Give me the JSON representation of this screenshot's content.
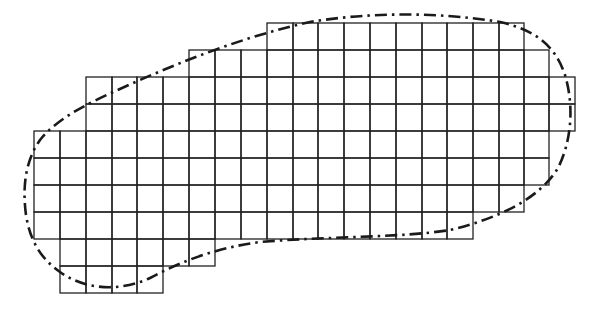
{
  "figure": {
    "colors": {
      "background": "#ffffff",
      "grid_line": "#222222",
      "boundary": "#1a1a1a"
    },
    "grid": {
      "x_lines": [
        34,
        60,
        86,
        112,
        137,
        163,
        189,
        215,
        241,
        267,
        293,
        318,
        344,
        370,
        396,
        422,
        447,
        473,
        499,
        524,
        549,
        575
      ],
      "y_lines": [
        23,
        50,
        77,
        104,
        131,
        158,
        185,
        212,
        239,
        266,
        293
      ],
      "columns": [
        {
          "col": 0,
          "top": 4,
          "bottom": 8
        },
        {
          "col": 1,
          "top": 4,
          "bottom": 10
        },
        {
          "col": 2,
          "top": 2,
          "bottom": 10
        },
        {
          "col": 3,
          "top": 2,
          "bottom": 10
        },
        {
          "col": 4,
          "top": 2,
          "bottom": 10
        },
        {
          "col": 5,
          "top": 2,
          "bottom": 9
        },
        {
          "col": 6,
          "top": 1,
          "bottom": 9
        },
        {
          "col": 7,
          "top": 1,
          "bottom": 8
        },
        {
          "col": 8,
          "top": 1,
          "bottom": 8
        },
        {
          "col": 9,
          "top": 0,
          "bottom": 8
        },
        {
          "col": 10,
          "top": 0,
          "bottom": 8
        },
        {
          "col": 11,
          "top": 0,
          "bottom": 8
        },
        {
          "col": 12,
          "top": 0,
          "bottom": 8
        },
        {
          "col": 13,
          "top": 0,
          "bottom": 8
        },
        {
          "col": 14,
          "top": 0,
          "bottom": 8
        },
        {
          "col": 15,
          "top": 0,
          "bottom": 8
        },
        {
          "col": 16,
          "top": 0,
          "bottom": 8
        },
        {
          "col": 17,
          "top": 0,
          "bottom": 7
        },
        {
          "col": 18,
          "top": 0,
          "bottom": 7
        },
        {
          "col": 19,
          "top": 1,
          "bottom": 6
        },
        {
          "col": 20,
          "top": 2,
          "bottom": 4
        }
      ]
    },
    "boundary": {
      "style": "dash-dot",
      "path": "M 26 215 C 22 185, 26 160, 40 140 C 60 115, 95 100, 140 80 C 190 58, 250 35, 310 22 C 370 12, 440 12, 500 22 C 535 30, 555 45, 565 75 C 574 105, 572 140, 558 168 C 540 198, 500 218, 450 230 C 400 238, 330 236, 260 242 C 215 248, 180 262, 150 278 C 120 292, 85 290, 60 272 C 40 258, 30 240, 26 215 Z"
    }
  }
}
